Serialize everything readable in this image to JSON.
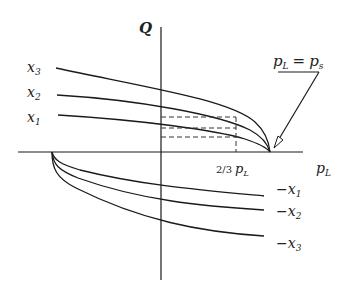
{
  "diagram": {
    "y_axis_label": "Q",
    "x_axis_label": "pL",
    "x_axis_label_main": "p",
    "x_axis_label_sub": "L",
    "tick_label_prefix": "2/3",
    "tick_label_main": "p",
    "tick_label_sub": "L",
    "annotation_lhs": "p",
    "annotation_lhs_sub": "L",
    "annotation_eq": "=",
    "annotation_rhs": "p",
    "annotation_rhs_sub": "s",
    "positive_curves": [
      {
        "label": "x",
        "sub": "3"
      },
      {
        "label": "x",
        "sub": "2"
      },
      {
        "label": "x",
        "sub": "1"
      }
    ],
    "negative_curves": [
      {
        "label": "−x",
        "sub": "1"
      },
      {
        "label": "−x",
        "sub": "2"
      },
      {
        "label": "−x",
        "sub": "3"
      }
    ]
  }
}
